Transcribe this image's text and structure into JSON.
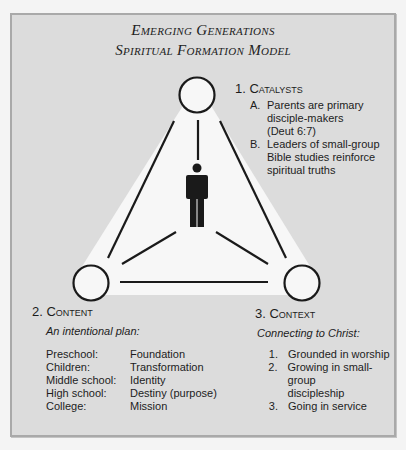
{
  "title": {
    "line1": "Emerging Generations",
    "line2": "Spiritual Formation Model"
  },
  "catalysts": {
    "heading": "1. Catalysts",
    "items": [
      {
        "marker": "A.",
        "lines": [
          "Parents are primary",
          "disciple-makers",
          "(Deut 6:7)"
        ]
      },
      {
        "marker": "B.",
        "lines": [
          "Leaders of small-group",
          "Bible studies reinforce",
          "spiritual truths"
        ]
      }
    ]
  },
  "content": {
    "heading": "2. Content",
    "subtitle": "An intentional plan:",
    "rows": [
      {
        "stage": "Preschool:",
        "focus": "Foundation"
      },
      {
        "stage": "Children:",
        "focus": "Transformation"
      },
      {
        "stage": "Middle school:",
        "focus": "Identity"
      },
      {
        "stage": "High school:",
        "focus": "Destiny (purpose)"
      },
      {
        "stage": "College:",
        "focus": "Mission"
      }
    ]
  },
  "context": {
    "heading": "3. Context",
    "subtitle": "Connecting to Christ:",
    "items": [
      {
        "marker": "1.",
        "lines": [
          "Grounded in worship"
        ]
      },
      {
        "marker": "2.",
        "lines": [
          "Growing in small-group",
          "discipleship"
        ]
      },
      {
        "marker": "3.",
        "lines": [
          "Going in service"
        ]
      }
    ]
  },
  "diagram": {
    "center_icon": "person-icon",
    "nodes": [
      "catalysts-node",
      "content-node",
      "context-node"
    ]
  },
  "colors": {
    "panel": "#dcdcdc",
    "border": "#a9a9a9",
    "triangle": "#f7f7f7",
    "ink": "#1a1a1a"
  }
}
